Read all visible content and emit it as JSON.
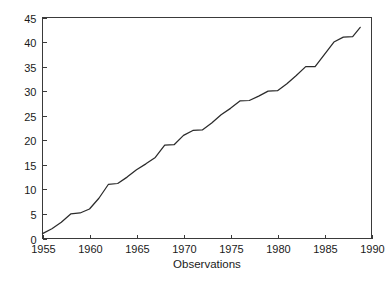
{
  "chart_data": {
    "type": "line",
    "title": "",
    "xlabel": "Observations",
    "ylabel": "",
    "xlim": [
      1955,
      1990
    ],
    "ylim": [
      0,
      45
    ],
    "grid": false,
    "legend": null,
    "xticks": [
      1955,
      1960,
      1965,
      1970,
      1975,
      1980,
      1985,
      1990
    ],
    "yticks": [
      0,
      5,
      10,
      15,
      20,
      25,
      30,
      35,
      40,
      45
    ],
    "xtick_labels": [
      "1955",
      "1960",
      "1965",
      "1970",
      "1975",
      "1980",
      "1985",
      "1990"
    ],
    "ytick_labels": [
      "0",
      "5",
      "10",
      "15",
      "20",
      "25",
      "30",
      "35",
      "40",
      "45"
    ],
    "series": [
      {
        "name": "cumulative observations",
        "color": "#2b2b2b",
        "x": [
          1955,
          1956,
          1957,
          1958,
          1959,
          1960,
          1961,
          1962,
          1963,
          1964,
          1965,
          1966,
          1967,
          1968,
          1969,
          1970,
          1971,
          1972,
          1973,
          1974,
          1975,
          1976,
          1977,
          1978,
          1979,
          1980,
          1981,
          1982,
          1983,
          1984,
          1985,
          1986,
          1987,
          1988,
          1988.8
        ],
        "y": [
          1,
          2,
          3.3,
          5,
          5.2,
          6,
          8.2,
          11,
          11.2,
          12.5,
          14,
          15.2,
          16.5,
          19,
          19.1,
          21,
          22,
          22.1,
          23.5,
          25.2,
          26.5,
          28,
          28.1,
          29,
          30,
          30.1,
          31.5,
          33.2,
          35,
          35,
          37.5,
          40,
          41,
          41.1,
          43
        ]
      }
    ]
  },
  "axis": {
    "x_title": "Observations"
  }
}
